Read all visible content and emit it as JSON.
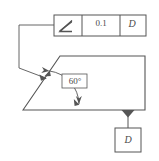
{
  "drawing": {
    "title": "Angularity geometric tolerance callout",
    "line_color": "#555555",
    "text_color": "#4a4a4a",
    "background": "#ffffff"
  },
  "feature_control_frame": {
    "name": "feature-control-frame",
    "symbol": "angularity-icon",
    "symbol_label": "angularity",
    "tolerance_value": "0.1",
    "datum_reference": "D"
  },
  "part": {
    "name": "chamfered-block-outline",
    "angle_dimension": {
      "label": "60°",
      "value": 60,
      "unit": "degrees"
    }
  },
  "datum_feature": {
    "name": "datum-feature-symbol",
    "letter": "D",
    "indicator": "filled-triangle"
  },
  "leader": {
    "name": "leader-line",
    "arrow": "arrowhead"
  }
}
